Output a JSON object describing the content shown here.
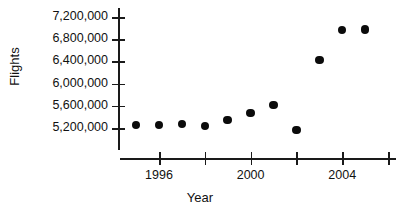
{
  "chart_data": {
    "type": "scatter",
    "title": "",
    "xlabel": "Year",
    "ylabel": "Flights",
    "x": [
      1995,
      1996,
      1997,
      1998,
      1999,
      2000,
      2001,
      2002,
      2003,
      2004,
      2005
    ],
    "values": [
      5255000,
      5255000,
      5275000,
      5235000,
      5345000,
      5470000,
      5615000,
      5165000,
      6425000,
      6970000,
      6975000
    ],
    "series": [
      {
        "name": "Flights",
        "values": [
          5255000,
          5255000,
          5275000,
          5235000,
          5345000,
          5470000,
          5615000,
          5165000,
          6425000,
          6970000,
          6975000
        ]
      }
    ],
    "ylim": [
      5000000,
      7400000
    ],
    "xlim": [
      1994,
      2006
    ],
    "ytick_values": [
      5200000,
      5600000,
      6000000,
      6400000,
      6800000,
      7200000
    ],
    "ytick_labels": [
      "5,200,000",
      "5,600,000",
      "6,000,000",
      "6,400,000",
      "6,800,000",
      "7,200,000"
    ],
    "xtick_values": [
      1996,
      1998,
      2000,
      2002,
      2004,
      2006
    ],
    "xtick_labels": [
      "1996",
      "",
      "2000",
      "",
      "2004",
      ""
    ],
    "grid": false,
    "legend": false,
    "marker_color": "#0b0b0b",
    "axis_color": "#1a1a1a"
  },
  "axis": {
    "ylabel": "Flights",
    "xlabel": "Year"
  }
}
